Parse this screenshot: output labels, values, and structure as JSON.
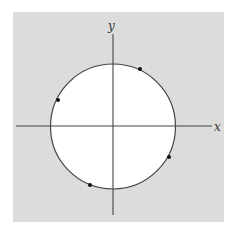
{
  "figure": {
    "panel": {
      "x": 13,
      "y": 12,
      "width": 211,
      "height": 210,
      "fill": "#dcdcdc"
    },
    "circle": {
      "cx": 113,
      "cy": 126.5,
      "r": 62.5,
      "fill": "#ffffff",
      "stroke": "#444444"
    },
    "axes": {
      "x_axis": {
        "x1": 16,
        "x2": 212,
        "y": 126,
        "label": "x",
        "label_x": 214,
        "label_y": 131
      },
      "y_axis": {
        "x": 113,
        "y1": 34,
        "y2": 215,
        "label": "y",
        "label_x": 108,
        "label_y": 30
      },
      "color": "#444444"
    },
    "points": [
      {
        "name": "point-1",
        "x": 140,
        "y": 69,
        "angle_deg": 65
      },
      {
        "name": "point-2",
        "x": 58,
        "y": 100,
        "angle_deg": 154
      },
      {
        "name": "point-3",
        "x": 169,
        "y": 157,
        "angle_deg": 331
      },
      {
        "name": "point-4",
        "x": 90,
        "y": 185,
        "angle_deg": 248
      }
    ],
    "point_color": "#111111"
  }
}
